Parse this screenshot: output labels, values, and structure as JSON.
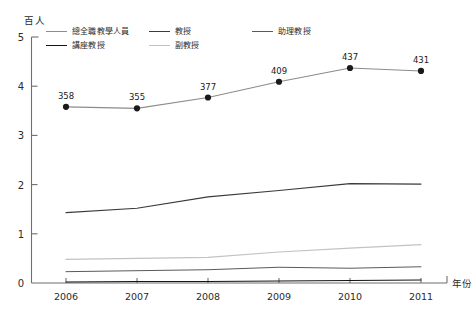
{
  "chart_data": {
    "type": "line",
    "title": "",
    "unit_label": "百人",
    "xlabel": "年份",
    "ylabel": "",
    "categories": [
      "2006",
      "2007",
      "2008",
      "2009",
      "2010",
      "2011"
    ],
    "x": [
      2006,
      2007,
      2008,
      2009,
      2010,
      2011
    ],
    "ylim": [
      0,
      5
    ],
    "yticks": [
      "0",
      "1",
      "2",
      "3",
      "4",
      "5"
    ],
    "ytick_values": [
      0,
      1,
      2,
      3,
      4,
      5
    ],
    "grid": false,
    "legend_position": "top-left-inside",
    "series": [
      {
        "name": "總全職教學人員",
        "color": "#8c8c8c",
        "width": 1.1,
        "markers": true,
        "marker_color": "#1a1a1a",
        "values": [
          3.58,
          3.55,
          3.77,
          4.09,
          4.37,
          4.31
        ],
        "data_labels": [
          "358",
          "355",
          "377",
          "409",
          "437",
          "431"
        ]
      },
      {
        "name": "教授",
        "color": "#3a3a3a",
        "width": 1.1,
        "markers": false,
        "values": [
          1.43,
          1.52,
          1.75,
          1.88,
          2.02,
          2.01
        ],
        "data_labels": []
      },
      {
        "name": "助理教授",
        "color": "#5a5a5a",
        "width": 1.0,
        "markers": false,
        "values": [
          0.23,
          0.25,
          0.27,
          0.32,
          0.3,
          0.33
        ],
        "data_labels": []
      },
      {
        "name": "講座教授",
        "color": "#141414",
        "width": 1.1,
        "markers": false,
        "values": [
          0.02,
          0.03,
          0.03,
          0.04,
          0.05,
          0.06
        ],
        "data_labels": []
      },
      {
        "name": "副教授",
        "color": "#c2c2c2",
        "width": 1.2,
        "markers": false,
        "values": [
          0.48,
          0.5,
          0.52,
          0.63,
          0.71,
          0.78
        ],
        "data_labels": []
      }
    ],
    "legend_rows": [
      [
        "總全職教學人員",
        "教授",
        "助理教授"
      ],
      [
        "講座教授",
        "副教授"
      ]
    ]
  }
}
